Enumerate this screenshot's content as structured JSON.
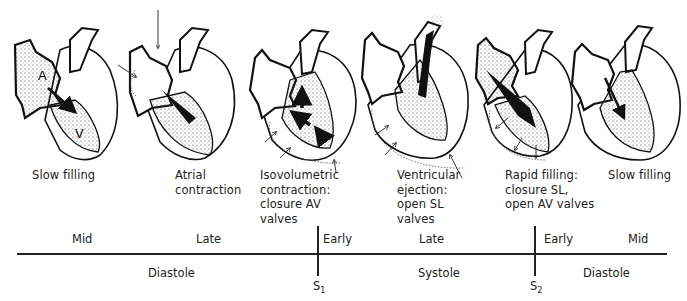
{
  "figure": {
    "panels": [
      {
        "id": "slow-filling-1",
        "label": "Slow filling",
        "inner_labels": [
          "A",
          "V"
        ]
      },
      {
        "id": "atrial-contraction",
        "label": "Atrial\ncontraction"
      },
      {
        "id": "isovolumetric-contraction",
        "label": "Isovolumetric\ncontraction:\nclosure AV\nvalves"
      },
      {
        "id": "ventricular-ejection",
        "label": "Ventricular\nejection:\nopen SL\nvalves"
      },
      {
        "id": "rapid-filling",
        "label": "Rapid filling:\nclosure SL,\nopen AV valves"
      },
      {
        "id": "slow-filling-2",
        "label": "Slow filling"
      }
    ],
    "timeline": {
      "upper_labels": [
        "Mid",
        "Late",
        "Early",
        "Late",
        "Early",
        "Mid"
      ],
      "lower_labels": [
        "Diastole",
        "Systole",
        "Diastole"
      ],
      "markers": [
        {
          "name": "S",
          "sub": "1"
        },
        {
          "name": "S",
          "sub": "2"
        }
      ]
    },
    "colors": {
      "ink": "#1a1a1a",
      "background": "#ffffff"
    }
  }
}
